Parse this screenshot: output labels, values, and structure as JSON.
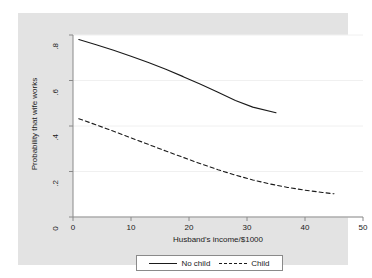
{
  "chart_data": {
    "type": "line",
    "title": "",
    "xlabel": "Husband's income/$1000",
    "ylabel": "Probability that wife works",
    "xlim": [
      0,
      50
    ],
    "ylim": [
      0,
      0.8
    ],
    "xticks": [
      "0",
      "10",
      "20",
      "30",
      "40",
      "50"
    ],
    "xtick_values": [
      0,
      10,
      20,
      30,
      40,
      50
    ],
    "yticks": [
      "0",
      ".2",
      ".4",
      ".6",
      ".8"
    ],
    "ytick_values": [
      0,
      0.2,
      0.4,
      0.6,
      0.8
    ],
    "grid": "horizontal",
    "legend_position": "bottom",
    "series": [
      {
        "name": "No child",
        "style": "solid",
        "color": "#1a1a1a",
        "x": [
          1,
          4,
          7,
          10,
          13,
          16,
          19,
          22,
          25,
          28,
          31,
          35
        ],
        "values": [
          0.78,
          0.757,
          0.733,
          0.707,
          0.679,
          0.649,
          0.617,
          0.583,
          0.548,
          0.512,
          0.483,
          0.458
        ]
      },
      {
        "name": "Child",
        "style": "dashed",
        "color": "#1a1a1a",
        "x": [
          1,
          4,
          7,
          10,
          13,
          16,
          19,
          22,
          25,
          28,
          31,
          34,
          37,
          40,
          43,
          45
        ],
        "values": [
          0.432,
          0.405,
          0.377,
          0.348,
          0.319,
          0.29,
          0.262,
          0.234,
          0.208,
          0.184,
          0.163,
          0.145,
          0.13,
          0.118,
          0.108,
          0.102
        ]
      }
    ]
  },
  "legend": {
    "entries": [
      {
        "label": "No child",
        "style": "solid"
      },
      {
        "label": "Child",
        "style": "dashed"
      }
    ]
  },
  "colors": {
    "graph_region": "#e3e3e3",
    "plot_region": "#ffffff",
    "line": "#1a1a1a",
    "grid": "#f0f0f0",
    "axis": "#8a8a8a"
  }
}
